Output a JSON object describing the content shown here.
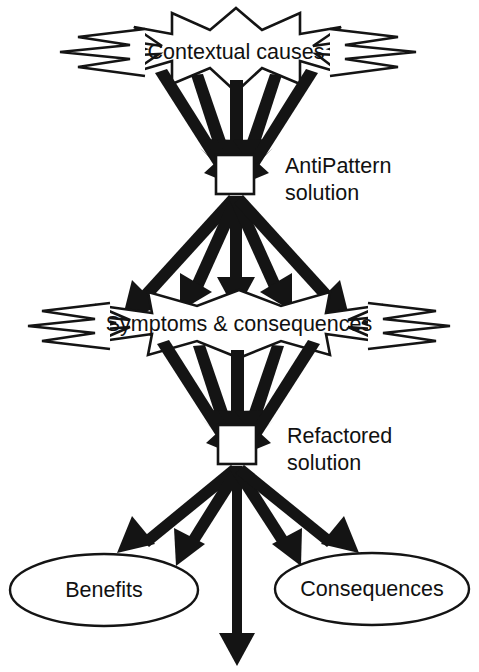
{
  "diagram": {
    "background_color": "#ffffff",
    "line_color": "#141414",
    "text_color": "#111111",
    "nodes": {
      "contextual_causes": {
        "label": "Contextual causes",
        "shape": "explosion",
        "center_x": 236,
        "center_y": 52
      },
      "antipattern_solution": {
        "label_line1": "AntiPattern",
        "label_line2": "solution",
        "shape": "box",
        "center_x": 235,
        "center_y": 174
      },
      "symptoms_consequences": {
        "label": "Symptoms & consequences",
        "shape": "explosion",
        "center_x": 239,
        "center_y": 324
      },
      "refactored_solution": {
        "label_line1": "Refactored",
        "label_line2": "solution",
        "shape": "box",
        "center_x": 236,
        "center_y": 444
      },
      "benefits": {
        "label": "Benefits",
        "shape": "ellipse",
        "center_x": 104,
        "center_y": 590
      },
      "consequences": {
        "label": "Consequences",
        "shape": "ellipse",
        "center_x": 372,
        "center_y": 589
      }
    },
    "edges": [
      {
        "from": "contextual_causes",
        "to": "antipattern_solution",
        "count": 5,
        "direction": "converging-down"
      },
      {
        "from": "antipattern_solution",
        "to": "symptoms_consequences",
        "count": 5,
        "direction": "fanning-down"
      },
      {
        "from": "symptoms_consequences",
        "to": "refactored_solution",
        "count": 5,
        "direction": "converging-down"
      },
      {
        "from": "refactored_solution",
        "to": "benefits",
        "count": 2,
        "direction": "fanning-down-left"
      },
      {
        "from": "refactored_solution",
        "to": "consequences",
        "count": 2,
        "direction": "fanning-down-right"
      },
      {
        "from": "refactored_solution",
        "to": "below",
        "count": 1,
        "direction": "straight-down"
      }
    ]
  }
}
